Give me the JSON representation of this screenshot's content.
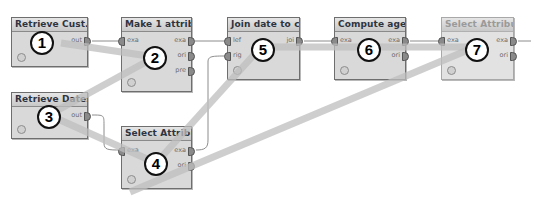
{
  "diagram": {
    "type": "process-workflow",
    "colors": {
      "node_body": "#d9d9d9",
      "node_border": "#6e6e6e",
      "highlight_band": "#c8c8c8",
      "wire": "#8c8c8c"
    },
    "nodes": [
      {
        "id": 1,
        "badge": "1",
        "title": "Retrieve Cust...",
        "inputs": [],
        "outputs": [
          "out"
        ],
        "disabled": false
      },
      {
        "id": 2,
        "badge": "2",
        "title": "Make 1 attrib ...",
        "inputs": [
          "exa"
        ],
        "outputs": [
          "exa",
          "ori",
          "pre"
        ],
        "disabled": false
      },
      {
        "id": 3,
        "badge": "3",
        "title": "Retrieve Dates",
        "inputs": [],
        "outputs": [
          "out"
        ],
        "disabled": false
      },
      {
        "id": 4,
        "badge": "4",
        "title": "Select Attribu...",
        "inputs": [
          "exa"
        ],
        "outputs": [
          "exa",
          "ori"
        ],
        "disabled": false
      },
      {
        "id": 5,
        "badge": "5",
        "title": "Join date to c...",
        "inputs": [
          "lef",
          "rig"
        ],
        "outputs": [
          "joi"
        ],
        "disabled": false
      },
      {
        "id": 6,
        "badge": "6",
        "title": "Compute age",
        "inputs": [
          "exa"
        ],
        "outputs": [
          "exa",
          "ori"
        ],
        "disabled": false
      },
      {
        "id": 7,
        "badge": "7",
        "title": "Select Attribu...",
        "inputs": [
          "exa"
        ],
        "outputs": [
          "exa",
          "ori"
        ],
        "disabled": true
      }
    ],
    "connections": [
      {
        "from": "1.out",
        "to": "2.exa"
      },
      {
        "from": "2.exa",
        "to": "5.lef"
      },
      {
        "from": "3.out",
        "to": "4.exa"
      },
      {
        "from": "4.exa",
        "to": "5.rig"
      },
      {
        "from": "5.joi",
        "to": "6.exa"
      },
      {
        "from": "6.exa",
        "to": "7.exa"
      },
      {
        "from": "7.exa",
        "to": "process-output"
      }
    ],
    "sequence_path": [
      "1",
      "2",
      "3",
      "4",
      "5",
      "6",
      "7"
    ]
  }
}
